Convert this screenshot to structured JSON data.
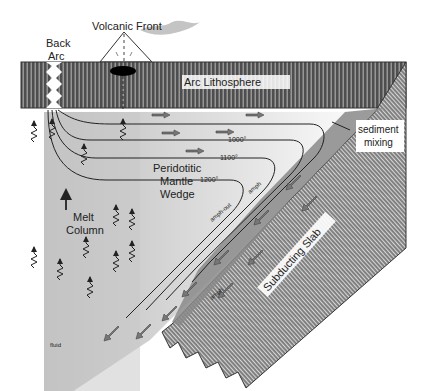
{
  "diagram": {
    "type": "subduction-zone-cross-section",
    "labels": {
      "volcanic_front": "Volcanic Front",
      "back_arc_line1": "Back",
      "back_arc_line2": "Arc",
      "arc_lithosphere": "Arc Lithosphere",
      "sediment_line1": "sediment",
      "sediment_line2": "mixing",
      "mantle_line1": "Peridotitic",
      "mantle_line2": "Mantle",
      "mantle_line3": "Wedge",
      "melt_line1": "Melt",
      "melt_line2": "Column",
      "subducting_slab": "Subducting Slab",
      "amph_upper": "amph",
      "amph_out": "amph-out",
      "amph_lower": "amph",
      "fluid": "fluid"
    },
    "isotherms": [
      {
        "label": "1000°"
      },
      {
        "label": "1100°"
      },
      {
        "label": "1200°"
      }
    ],
    "colors": {
      "lithosphere": "#5a5a5a",
      "slab": "#8a8a8a",
      "shear_zone": "#7d7d7d",
      "melt_column": "#c4c4c4",
      "background": "#ffffff"
    }
  }
}
